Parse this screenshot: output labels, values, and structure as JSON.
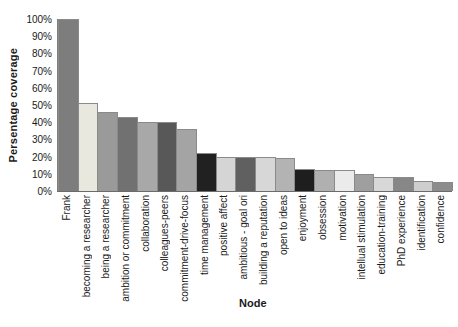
{
  "chart_data": {
    "type": "bar",
    "title": "",
    "ylabel": "Persentage coverage",
    "xlabel": "Node",
    "ylim": [
      0,
      100
    ],
    "grid": false,
    "legend": "none",
    "yticks": [
      "0%",
      "10%",
      "20%",
      "30%",
      "40%",
      "50%",
      "60%",
      "70%",
      "80%",
      "90%",
      "100%"
    ],
    "categories": [
      "Frank",
      "becoming a researcher",
      "being a researcher",
      "ambition or commitment",
      "collaboration",
      "colleagues-peers",
      "commitment-drive-focus",
      "time management",
      "positive affect",
      "ambitious - goal ori",
      "building a reputation",
      "open to ideas",
      "enjoyment",
      "obsession",
      "motivation",
      "intellual stimulation",
      "education-training",
      "PhD experience",
      "identification",
      "confidence"
    ],
    "values": [
      100,
      51,
      46,
      43,
      40,
      40,
      36,
      22,
      20,
      20,
      20,
      19,
      13,
      12,
      12,
      10,
      8,
      8,
      6,
      5
    ],
    "bar_colors": [
      "#7d7d7d",
      "#e9e8df",
      "#9a9a9a",
      "#717171",
      "#a8a8a8",
      "#585858",
      "#a4a4a4",
      "#212121",
      "#d5d5d5",
      "#606060",
      "#d7d7d7",
      "#b3b3b3",
      "#1e1e1e",
      "#b0b0b0",
      "#ebebeb",
      "#9f9f9f",
      "#d8d8d8",
      "#878787",
      "#cecece",
      "#8d8d8d"
    ],
    "bar_border_color": "#8a8a8a",
    "axis_color": "#6b6b6b"
  }
}
